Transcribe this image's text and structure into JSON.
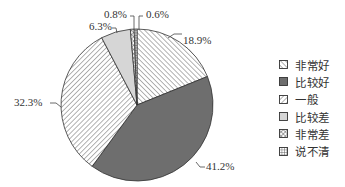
{
  "chart_data": {
    "type": "pie",
    "title": "",
    "start_angle_deg": 0,
    "direction": "clockwise",
    "slices": [
      {
        "label": "非常好",
        "value": 18.9,
        "display": "18.9%",
        "pattern": "hatch-back",
        "label_pos": [
          183,
          44
        ],
        "leader": [
          [
            168,
            38
          ],
          [
            174,
            34
          ],
          [
            182,
            34
          ]
        ],
        "anchor": "start"
      },
      {
        "label": "比较好",
        "value": 41.2,
        "display": "41.2%",
        "pattern": "solid-dark",
        "label_pos": [
          206,
          170
        ],
        "leader": [
          [
            196,
            162
          ],
          [
            200,
            167
          ],
          [
            205,
            167
          ]
        ],
        "anchor": "start"
      },
      {
        "label": "一般",
        "value": 32.3,
        "display": "32.3%",
        "pattern": "hatch-fwd",
        "label_pos": [
          14,
          106
        ],
        "leader": [
          [
            61,
            107
          ],
          [
            56,
            103
          ],
          [
            50,
            103
          ]
        ],
        "anchor": "start"
      },
      {
        "label": "比较差",
        "value": 6.3,
        "display": "6.3%",
        "pattern": "solid-light",
        "label_pos": [
          89,
          30
        ],
        "leader": [
          [
            117,
            33
          ],
          [
            116,
            28
          ],
          [
            112,
            28
          ]
        ],
        "anchor": "start"
      },
      {
        "label": "非常差",
        "value": 0.8,
        "display": "0.8%",
        "pattern": "crosshatch",
        "label_pos": [
          104,
          18
        ],
        "leader": [
          [
            134,
            30
          ],
          [
            134,
            16
          ],
          [
            130,
            16
          ]
        ],
        "anchor": "start"
      },
      {
        "label": "说不清",
        "value": 0.6,
        "display": "0.6%",
        "pattern": "grid",
        "label_pos": [
          146,
          18
        ],
        "leader": [
          [
            139,
            30
          ],
          [
            139,
            16
          ],
          [
            143,
            16
          ]
        ],
        "anchor": "start"
      }
    ],
    "legend_position": "right"
  },
  "legend": {
    "items": [
      {
        "label": "非常好",
        "pattern": "hatch-back"
      },
      {
        "label": "比较好",
        "pattern": "solid-dark"
      },
      {
        "label": "一般",
        "pattern": "hatch-fwd"
      },
      {
        "label": "比较差",
        "pattern": "solid-light"
      },
      {
        "label": "非常差",
        "pattern": "crosshatch"
      },
      {
        "label": "说不清",
        "pattern": "grid"
      }
    ]
  },
  "colors": {
    "solid_dark": "#6e6e6e",
    "solid_light": "#d6d6d6",
    "hatch": "#555555",
    "outline": "#333333"
  }
}
